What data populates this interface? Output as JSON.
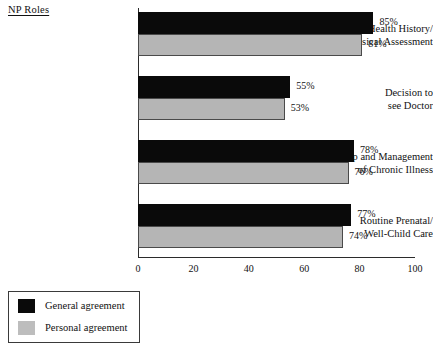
{
  "chart_data": {
    "type": "bar",
    "orientation": "horizontal",
    "title": "",
    "axis_group_title": "NP Roles",
    "xlabel": "",
    "ylabel": "",
    "xlim": [
      0,
      100
    ],
    "xticks": [
      0,
      20,
      40,
      60,
      80,
      100
    ],
    "xtick_labels": [
      "0",
      "20",
      "40",
      "60",
      "80",
      "100"
    ],
    "grid": false,
    "legend_position": "below-left",
    "value_label_suffix": "%",
    "categories": [
      "Health History/ Physical Assessment",
      "Decision to see Doctor",
      "Follow-up and Management of Chronic Illness",
      "Routine Prenatal/ Well-Child Care"
    ],
    "category_lines": [
      [
        "Health History/",
        "Physical Assessment"
      ],
      [
        "Decision to",
        "see Doctor"
      ],
      [
        "Follow-up and Management",
        "of Chronic Illness"
      ],
      [
        "Routine Prenatal/",
        "Well-Child Care"
      ]
    ],
    "series": [
      {
        "name": "General agreement",
        "color": "#0a0a0a",
        "values": [
          85,
          55,
          78,
          77
        ],
        "value_labels": [
          "85%",
          "55%",
          "78%",
          "77%"
        ]
      },
      {
        "name": "Personal agreement",
        "color": "#b5b5b5",
        "values": [
          81,
          53,
          76,
          74
        ],
        "value_labels": [
          "81%",
          "53%",
          "76%",
          "74%"
        ]
      }
    ]
  },
  "legend": {
    "items": [
      {
        "label": "General agreement",
        "color": "#0a0a0a"
      },
      {
        "label": "Personal agreement",
        "color": "#bdbdbd"
      }
    ]
  }
}
